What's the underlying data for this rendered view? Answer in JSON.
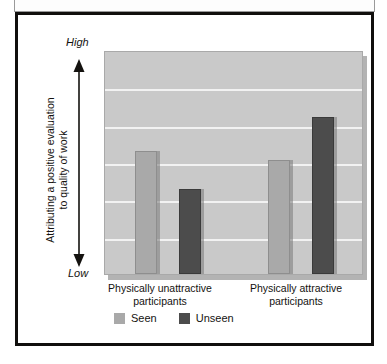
{
  "figure": {
    "frame_border_color": "#100f0d",
    "background": "#ffffff"
  },
  "axis": {
    "high_label": "High",
    "low_label": "Low",
    "title_line1": "Attributing a positive evaluation",
    "title_line2": "to quality of work",
    "arrow_icon": "double-headed-vertical-arrow"
  },
  "legend": {
    "position": "bottom-left",
    "items": [
      {
        "label": "Seen",
        "color": "#a9a9a9"
      },
      {
        "label": "Unseen",
        "color": "#4c4c4c"
      }
    ]
  },
  "categories": [
    {
      "line1": "Physically unattractive",
      "line2": "participants"
    },
    {
      "line1": "Physically attractive",
      "line2": "participants"
    }
  ],
  "chart_data": {
    "type": "bar",
    "title": "",
    "subtitle": "",
    "xlabel": "",
    "ylabel": "Attributing a positive evaluation to quality of work",
    "categories": [
      "Physically unattractive participants",
      "Physically attractive participants"
    ],
    "series": [
      {
        "name": "Seen",
        "color": "#a9a9a9",
        "values": [
          0.55,
          0.51
        ]
      },
      {
        "name": "Unseen",
        "color": "#4c4c4c",
        "values": [
          0.38,
          0.7
        ]
      }
    ],
    "ylim": [
      0,
      1
    ],
    "ytick_labels": [
      "Low",
      "High"
    ],
    "yaxis_qualitative": true,
    "grid": true,
    "gridline_count": 5,
    "gridline_color": "#f2f2f2",
    "plot_background": "#c9c9c9",
    "legend_position": "bottom-left",
    "annotations": []
  },
  "geometry": {
    "plot": {
      "x": 86,
      "y": 36,
      "w": 259,
      "h": 224
    },
    "gridline_fractions": [
      0.1667,
      0.3333,
      0.5,
      0.6667,
      0.8333
    ],
    "bars": [
      {
        "series": "Seen",
        "category": 0,
        "left": 30,
        "width": 22,
        "value": 0.55
      },
      {
        "series": "Unseen",
        "category": 0,
        "left": 74,
        "width": 22,
        "value": 0.38
      },
      {
        "series": "Seen",
        "category": 1,
        "left": 163,
        "width": 22,
        "value": 0.51
      },
      {
        "series": "Unseen",
        "category": 1,
        "left": 207,
        "width": 22,
        "value": 0.7
      }
    ]
  }
}
